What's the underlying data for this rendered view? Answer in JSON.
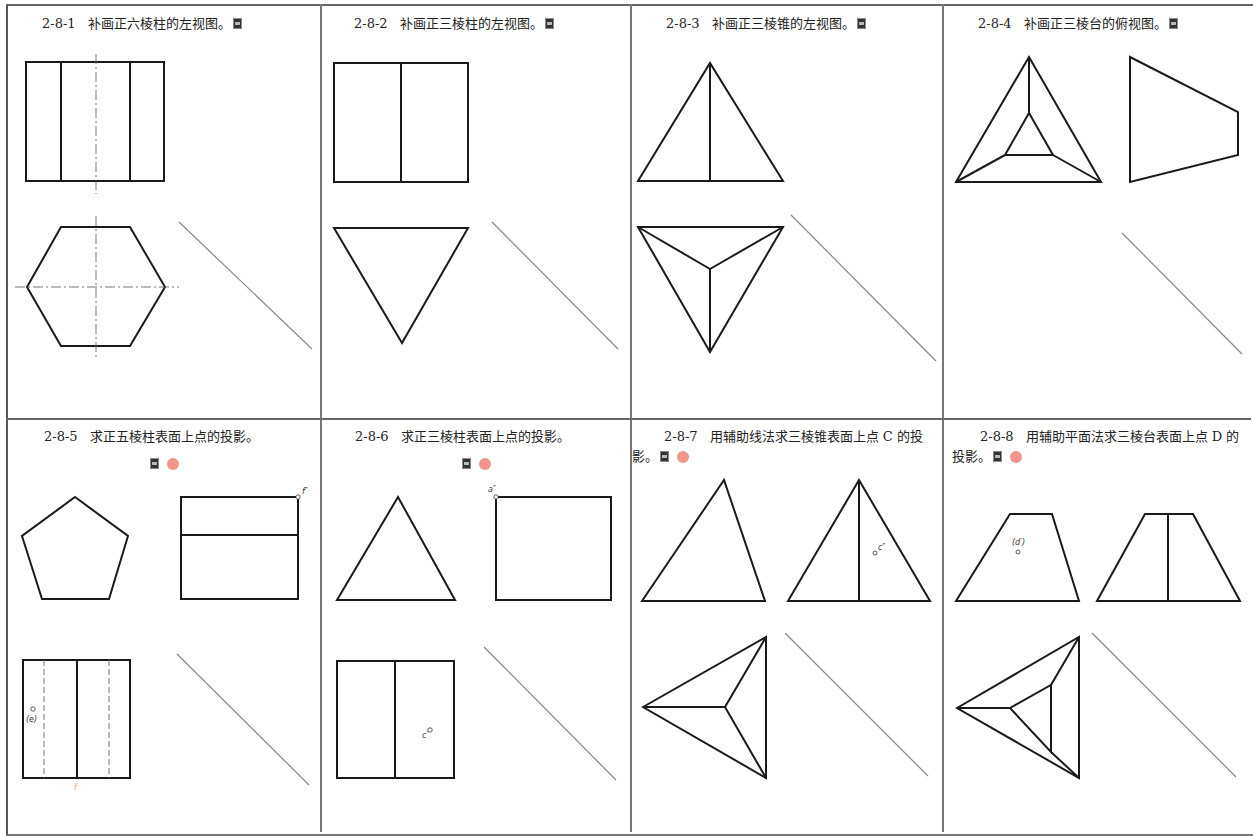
{
  "exercises": [
    {
      "id": "2-8-1",
      "number": "2-8-1",
      "text": "补画正六棱柱的左视图。",
      "icons": [
        "qr-code-icon"
      ]
    },
    {
      "id": "2-8-2",
      "number": "2-8-2",
      "text": "补画正三棱柱的左视图。",
      "icons": [
        "qr-code-icon"
      ]
    },
    {
      "id": "2-8-3",
      "number": "2-8-3",
      "text": "补画正三棱锥的左视图。",
      "icons": [
        "qr-code-icon"
      ]
    },
    {
      "id": "2-8-4",
      "number": "2-8-4",
      "text": "补画正三棱台的俯视图。",
      "icons": [
        "qr-code-icon"
      ]
    },
    {
      "id": "2-8-5",
      "number": "2-8-5",
      "text": "求正五棱柱表面上点的投影。",
      "icons": [
        "qr-code-icon",
        "answer-dot-icon"
      ],
      "point_labels": [
        "f″",
        "(e)",
        "f"
      ]
    },
    {
      "id": "2-8-6",
      "number": "2-8-6",
      "text": "求正三棱柱表面上点的投影。",
      "icons": [
        "qr-code-icon",
        "answer-dot-icon"
      ],
      "point_labels": [
        "a″",
        "c′"
      ]
    },
    {
      "id": "2-8-7",
      "number": "2-8-7",
      "text": "用辅助线法求三棱锥表面上点 C 的投影。",
      "icons": [
        "qr-code-icon",
        "answer-dot-icon"
      ],
      "point_labels": [
        "c″"
      ]
    },
    {
      "id": "2-8-8",
      "number": "2-8-8",
      "text": "用辅助平面法求三棱台表面上点 D 的投影。",
      "icons": [
        "qr-code-icon",
        "answer-dot-icon"
      ],
      "point_labels": [
        "(d′)"
      ]
    }
  ],
  "colors": {
    "line": "#1a1a1a",
    "construction_line": "#888888",
    "answer_dot": "#f0968a",
    "hint_orange": "#e8a070"
  }
}
